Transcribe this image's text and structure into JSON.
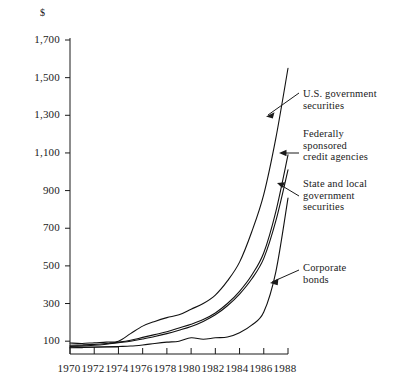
{
  "chart_data": {
    "type": "line",
    "title": "",
    "xlabel": "",
    "ylabel": "$",
    "unit_label": "$",
    "xlim": [
      1970,
      1988
    ],
    "ylim": [
      0,
      1700
    ],
    "grid": false,
    "legend_position": "inline-annotations",
    "x": [
      1970,
      1971,
      1972,
      1973,
      1974,
      1975,
      1976,
      1977,
      1978,
      1979,
      1980,
      1981,
      1982,
      1983,
      1984,
      1985,
      1986,
      1987,
      1988
    ],
    "y_ticks": [
      100,
      300,
      500,
      700,
      900,
      1100,
      1300,
      1500,
      1700
    ],
    "y_tick_labels": [
      "100",
      "300",
      "500",
      "700",
      "900",
      "1,100",
      "1,300",
      "1,500",
      "1,700"
    ],
    "x_ticks": [
      1970,
      1972,
      1974,
      1976,
      1978,
      1980,
      1982,
      1984,
      1986,
      1988
    ],
    "x_tick_labels": [
      "1970",
      "1972",
      "1974",
      "1976",
      "1978",
      "1980",
      "1982",
      "1984",
      "1986",
      "1988"
    ],
    "series": [
      {
        "name": "U.S. government securities",
        "label": "U.S. government\nsecurities",
        "color": "#111111",
        "values": [
          90,
          88,
          92,
          95,
          100,
          140,
          180,
          205,
          225,
          240,
          270,
          300,
          345,
          420,
          520,
          680,
          880,
          1180,
          1550
        ]
      },
      {
        "name": "Federally sponsored credit agencies",
        "label": "Federally\nsponsored\ncredit agencies",
        "color": "#111111",
        "values": [
          78,
          80,
          83,
          88,
          95,
          105,
          120,
          135,
          150,
          170,
          190,
          215,
          250,
          300,
          365,
          450,
          570,
          790,
          1090
        ]
      },
      {
        "name": "State and local government securities",
        "label": "State and local\ngovernment\nsecurities",
        "color": "#111111",
        "values": [
          72,
          75,
          78,
          84,
          92,
          100,
          112,
          125,
          140,
          158,
          178,
          205,
          240,
          288,
          350,
          430,
          540,
          740,
          1010
        ]
      },
      {
        "name": "Corporate bonds",
        "label": "Corporate\nbonds",
        "color": "#111111",
        "values": [
          65,
          66,
          68,
          70,
          72,
          74,
          80,
          88,
          95,
          100,
          118,
          110,
          118,
          122,
          145,
          185,
          255,
          470,
          860
        ]
      }
    ]
  },
  "annotations": [
    {
      "id": "us-government-securities",
      "text": "U.S. government\nsecurities",
      "x": 303,
      "y": 88
    },
    {
      "id": "federally-sponsored-credit-agencies",
      "text": "Federally\nsponsored\ncredit agencies",
      "x": 303,
      "y": 128
    },
    {
      "id": "state-and-local-government-securities",
      "text": "State and local\ngovernment\nsecurities",
      "x": 303,
      "y": 178
    },
    {
      "id": "corporate-bonds",
      "text": "Corporate\nbonds",
      "x": 303,
      "y": 262
    }
  ]
}
